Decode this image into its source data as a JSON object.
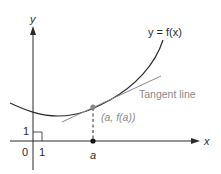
{
  "diagram": {
    "labels": {
      "y_axis": "y",
      "x_axis": "x",
      "curve": "y = f(x)",
      "tangent": "Tangent line",
      "point": "(a, f(a))",
      "a_tick": "a",
      "origin": "0",
      "x_unit": "1",
      "y_unit": "1"
    },
    "colors": {
      "curve": "#2a2a2a",
      "axes": "#2a2a2a",
      "tangent": "#8a8a8a",
      "point": "#8a8a8a",
      "text": "#2a2a2a"
    }
  }
}
